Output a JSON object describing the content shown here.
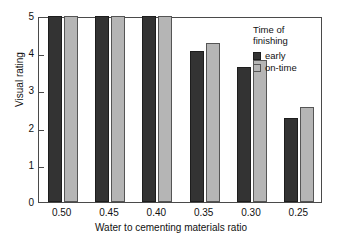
{
  "chart_data": {
    "type": "bar",
    "title": "",
    "xlabel": "Water to cementing materials ratio",
    "ylabel": "Visual rating",
    "categories": [
      "0.50",
      "0.45",
      "0.40",
      "0.35",
      "0.30",
      "0.25"
    ],
    "series": [
      {
        "name": "early",
        "color": "#333333",
        "values": [
          5.0,
          5.0,
          5.0,
          4.05,
          3.62,
          2.25
        ]
      },
      {
        "name": "on-time",
        "color": "#b5b5b5",
        "values": [
          5.0,
          5.0,
          5.0,
          4.28,
          3.82,
          2.55
        ]
      }
    ],
    "ylim": [
      0,
      5
    ],
    "yticks": [
      "0",
      "1",
      "2",
      "3",
      "4",
      "5"
    ],
    "ytick_values": [
      0,
      1,
      2,
      3,
      4,
      5
    ],
    "grid": false,
    "legend": {
      "title": "Time of\nfinishing",
      "position": "top-right",
      "entries": [
        "early",
        "on-time"
      ]
    }
  }
}
